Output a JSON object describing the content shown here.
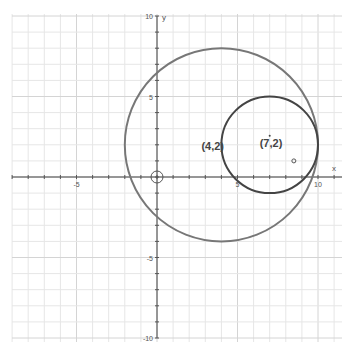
{
  "chart_data": {
    "type": "line",
    "title": "",
    "xlabel": "x",
    "ylabel": "y",
    "xlim": [
      -9.5,
      11.5
    ],
    "ylim": [
      -10,
      10
    ],
    "grid": true,
    "x_ticks": [
      -5,
      5,
      10
    ],
    "y_ticks": [
      10,
      5,
      -5,
      -10
    ],
    "tick_labels": {
      "x": [
        "-5",
        "5",
        "10"
      ],
      "y": [
        "10",
        "5",
        "-5",
        "-10"
      ]
    },
    "series": [
      {
        "name": "large-circle",
        "shape": "circle",
        "center": [
          4,
          2
        ],
        "radius": 6,
        "color": "#777777"
      },
      {
        "name": "small-circle",
        "shape": "circle",
        "center": [
          7,
          2
        ],
        "radius": 3,
        "color": "#444444"
      }
    ],
    "annotations": [
      {
        "text": "(4,2)",
        "x": 4,
        "y": 2
      },
      {
        "text": "(7,2)",
        "x": 7,
        "y": 2
      }
    ],
    "markers": [
      {
        "name": "origin-marker",
        "x": 0,
        "y": 0,
        "style": "open-circle"
      },
      {
        "name": "point-marker",
        "x": 8.5,
        "y": 1,
        "style": "small-open-circle"
      }
    ]
  },
  "axes": {
    "x_label": "x",
    "y_label": "y"
  }
}
